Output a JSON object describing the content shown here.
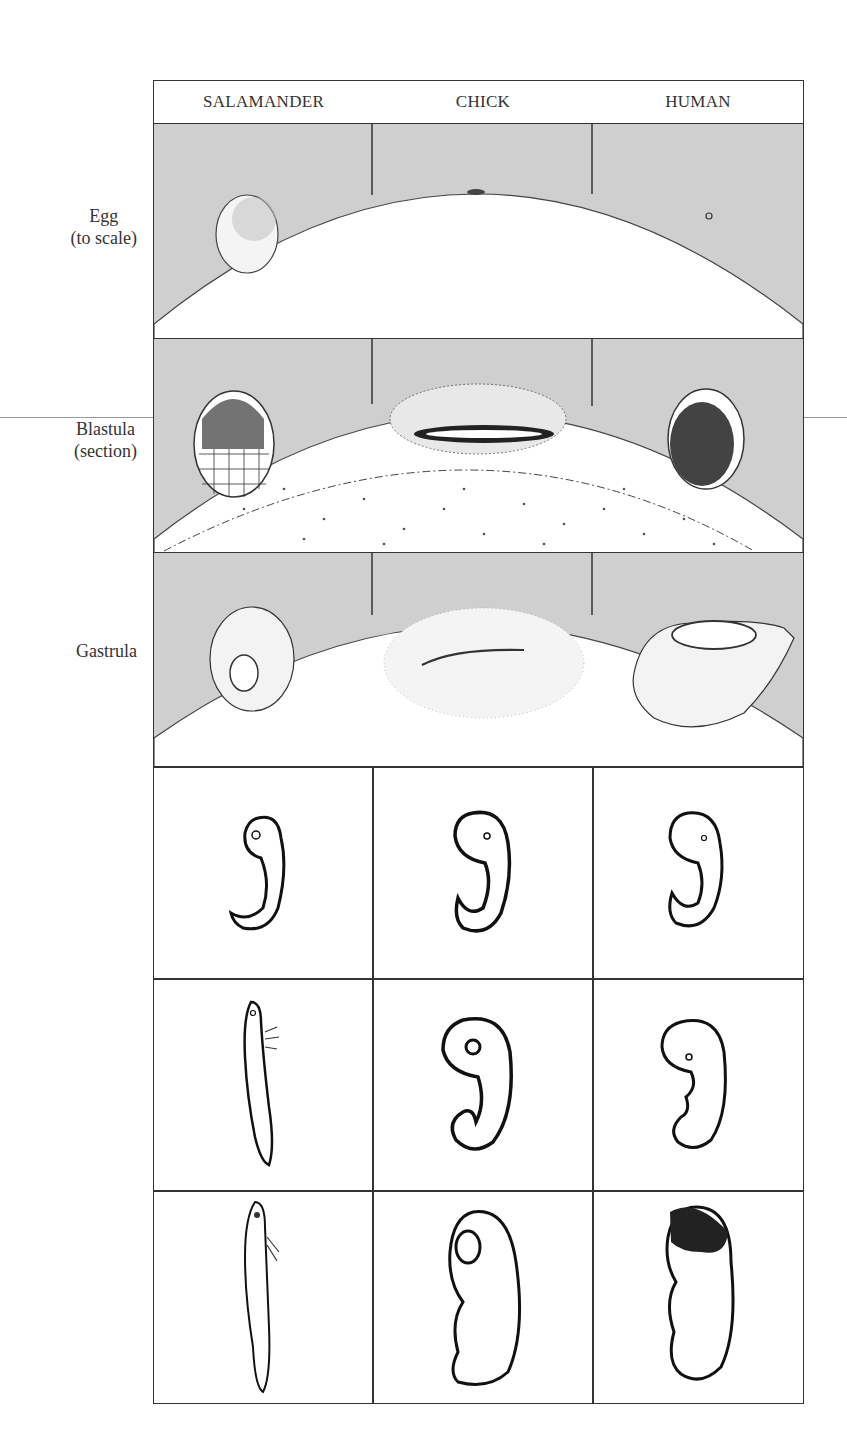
{
  "figure": {
    "columns": [
      "SALAMANDER",
      "CHICK",
      "HUMAN"
    ],
    "rows": [
      {
        "label_line1": "Egg",
        "label_line2": "(to scale)"
      },
      {
        "label_line1": "Blastula",
        "label_line2": "(section)"
      },
      {
        "label_line1": "Gastrula",
        "label_line2": ""
      },
      {
        "label_line1": "",
        "label_line2": ""
      },
      {
        "label_line1": "",
        "label_line2": ""
      },
      {
        "label_line1": "",
        "label_line2": ""
      }
    ],
    "stages": {
      "egg": [
        "salamander-egg",
        "chick-blastodisc",
        "human-egg"
      ],
      "blastula": [
        "salamander-blastula",
        "chick-blastoderm",
        "human-blastocyst"
      ],
      "gastrula": [
        "salamander-gastrula",
        "chick-primitive-streak",
        "human-gastrula"
      ],
      "early_embryo": [
        "salamander-early-embryo",
        "chick-early-embryo",
        "human-early-embryo"
      ],
      "mid_embryo": [
        "salamander-larva",
        "chick-mid-embryo",
        "human-mid-embryo"
      ],
      "late_embryo": [
        "salamander-late-larva",
        "chick-late-embryo",
        "human-fetus"
      ]
    },
    "colors": {
      "background_gray": "#cfcfcf",
      "line": "#333333",
      "yolk": "#ffffff"
    }
  }
}
